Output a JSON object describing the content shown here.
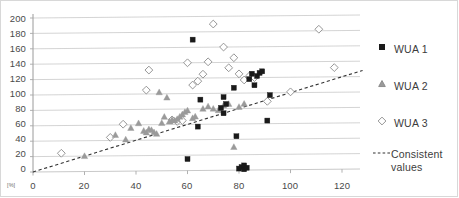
{
  "chart_data": {
    "type": "scatter",
    "title": "",
    "subtitle": "",
    "xlabel": "",
    "ylabel": "",
    "x_unit": "[%]",
    "xlim": [
      0,
      130
    ],
    "ylim": [
      0,
      200
    ],
    "x_ticks": [
      0,
      20,
      40,
      60,
      80,
      100,
      120
    ],
    "y_ticks": [
      0,
      20,
      40,
      60,
      80,
      100,
      120,
      140,
      160,
      180,
      200
    ],
    "grid": "horizontal",
    "legend_position": "right",
    "reference_line": {
      "name": "Consistent values",
      "style": "dashed",
      "color": "#333333",
      "from": [
        0,
        0
      ],
      "to": [
        128,
        128
      ]
    },
    "series": [
      {
        "name": "WUA 1",
        "marker": "square",
        "color": "#1a1a1a",
        "fill": "#1a1a1a",
        "points": [
          [
            62,
            170
          ],
          [
            60,
            15
          ],
          [
            65,
            92
          ],
          [
            64,
            57
          ],
          [
            73,
            81
          ],
          [
            74,
            95
          ],
          [
            74,
            74
          ],
          [
            75,
            86
          ],
          [
            78,
            107
          ],
          [
            79,
            44
          ],
          [
            80,
            2
          ],
          [
            81,
            4
          ],
          [
            82,
            1
          ],
          [
            82,
            6
          ],
          [
            83,
            3
          ],
          [
            84,
            118
          ],
          [
            85,
            125
          ],
          [
            86,
            110
          ],
          [
            87,
            122
          ],
          [
            88,
            126
          ],
          [
            89,
            128
          ],
          [
            91,
            64
          ],
          [
            92,
            97
          ]
        ]
      },
      {
        "name": "WUA 2",
        "marker": "triangle",
        "color": "#9a9a9a",
        "fill": "#9a9a9a",
        "points": [
          [
            20,
            20
          ],
          [
            32,
            47
          ],
          [
            36,
            41
          ],
          [
            38,
            56
          ],
          [
            41,
            62
          ],
          [
            43,
            52
          ],
          [
            44,
            50
          ],
          [
            45,
            54
          ],
          [
            46,
            53
          ],
          [
            47,
            50
          ],
          [
            48,
            48
          ],
          [
            49,
            102
          ],
          [
            50,
            62
          ],
          [
            51,
            70
          ],
          [
            52,
            95
          ],
          [
            53,
            64
          ],
          [
            54,
            66
          ],
          [
            55,
            65
          ],
          [
            56,
            67
          ],
          [
            57,
            70
          ],
          [
            58,
            73
          ],
          [
            59,
            76
          ],
          [
            60,
            78
          ],
          [
            62,
            68
          ],
          [
            63,
            70
          ],
          [
            66,
            80
          ],
          [
            68,
            83
          ],
          [
            70,
            80
          ],
          [
            72,
            78
          ],
          [
            74,
            84
          ],
          [
            76,
            86
          ],
          [
            78,
            30
          ],
          [
            80,
            82
          ],
          [
            82,
            86
          ]
        ]
      },
      {
        "name": "WUA 3",
        "marker": "diamond",
        "color": "#8a8a8a",
        "fill": "#ffffff",
        "points": [
          [
            11,
            24
          ],
          [
            30,
            44
          ],
          [
            35,
            61
          ],
          [
            44,
            105
          ],
          [
            45,
            131
          ],
          [
            54,
            66
          ],
          [
            56,
            64
          ],
          [
            58,
            65
          ],
          [
            60,
            140
          ],
          [
            62,
            111
          ],
          [
            64,
            116
          ],
          [
            66,
            125
          ],
          [
            68,
            141
          ],
          [
            70,
            190
          ],
          [
            74,
            160
          ],
          [
            76,
            133
          ],
          [
            78,
            146
          ],
          [
            80,
            125
          ],
          [
            82,
            117
          ],
          [
            84,
            122
          ],
          [
            86,
            120
          ],
          [
            91,
            89
          ],
          [
            100,
            101
          ],
          [
            111,
            182
          ],
          [
            117,
            132
          ]
        ]
      }
    ]
  },
  "axis": {
    "y_labels": [
      "200",
      "180",
      "160",
      "140",
      "120",
      "100",
      "80",
      "60",
      "40",
      "20",
      "0"
    ],
    "x_labels": [
      "0",
      "20",
      "40",
      "60",
      "80",
      "100",
      "120"
    ],
    "x_unit_label": "[%]"
  },
  "legend": {
    "entries": [
      {
        "label": "WUA 1",
        "marker": "square-filled-black"
      },
      {
        "label": "WUA 2",
        "marker": "triangle-filled-gray"
      },
      {
        "label": "WUA 3",
        "marker": "diamond-hollow"
      },
      {
        "label": "Consistent values",
        "marker": "dashed-line"
      }
    ]
  }
}
